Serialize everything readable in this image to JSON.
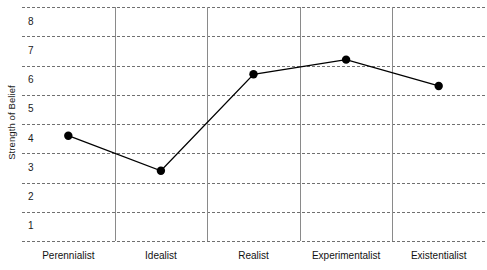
{
  "chart_data": {
    "type": "line",
    "title": "",
    "xlabel": "",
    "ylabel": "Strength of Belief",
    "categories": [
      "Perennialist",
      "Idealist",
      "Realist",
      "Experimentalist",
      "Existentialist"
    ],
    "values": [
      4.1,
      2.9,
      6.2,
      6.7,
      5.8
    ],
    "series": [
      {
        "name": "Strength of Belief",
        "values": [
          4.1,
          2.9,
          6.2,
          6.7,
          5.8
        ]
      }
    ],
    "yticks": [
      8,
      7,
      6,
      5,
      4,
      3,
      2,
      1
    ],
    "ytick_labels": [
      "8",
      "7",
      "6",
      "5",
      "4",
      "3",
      "2",
      "1"
    ],
    "ylim": [
      0.5,
      8.5
    ],
    "grid": "horizontal-dashed",
    "legend": "none",
    "marker": "filled-circle",
    "line_color": "#000000",
    "marker_color": "#000000",
    "grid_color": "#707070",
    "separator_color": "#8a8a8a",
    "category_separators": true
  }
}
